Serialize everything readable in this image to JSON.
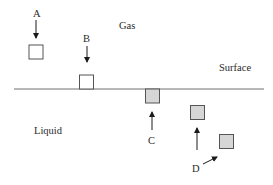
{
  "diagram": {
    "regions": {
      "gas": "Gas",
      "surface": "Surface",
      "liquid": "Liquid"
    },
    "labels": {
      "a": "A",
      "b": "B",
      "c": "C",
      "d": "D"
    },
    "colors": {
      "line": "#6e6e6e",
      "box_stroke": "#555555",
      "box_fill_gas": "#ffffff",
      "box_fill_liquid": "#d6d6d6",
      "arrow": "#1a1a1a"
    }
  }
}
